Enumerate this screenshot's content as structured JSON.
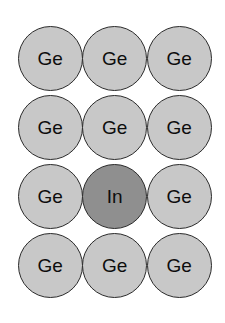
{
  "figure": {
    "type": "crystal-lattice-substitution-diagram",
    "background_color": "#ffffff",
    "grid": {
      "columns": 3,
      "rows": 4,
      "origin_x": 18,
      "origin_y": 24,
      "cell_width": 64.5,
      "cell_height": 69,
      "circle_diameter": 65
    },
    "styles": {
      "host_fill": "#c8c8c8",
      "dopant_fill": "#8f8f8f",
      "outline_color": "#2b2b2b",
      "outline_width": 1.4,
      "label_color": "#0d0d0d",
      "label_font_size": 19
    },
    "legend_note": "",
    "atoms": [
      {
        "id": "atom-r1c1",
        "label": "Ge",
        "row": 1,
        "col": 1,
        "kind": "host",
        "fill": "#c8c8c8"
      },
      {
        "id": "atom-r1c2",
        "label": "Ge",
        "row": 1,
        "col": 2,
        "kind": "host",
        "fill": "#c8c8c8"
      },
      {
        "id": "atom-r1c3",
        "label": "Ge",
        "row": 1,
        "col": 3,
        "kind": "host",
        "fill": "#c8c8c8"
      },
      {
        "id": "atom-r2c1",
        "label": "Ge",
        "row": 2,
        "col": 1,
        "kind": "host",
        "fill": "#c8c8c8"
      },
      {
        "id": "atom-r2c2",
        "label": "Ge",
        "row": 2,
        "col": 2,
        "kind": "host",
        "fill": "#c8c8c8"
      },
      {
        "id": "atom-r2c3",
        "label": "Ge",
        "row": 2,
        "col": 3,
        "kind": "host",
        "fill": "#c8c8c8"
      },
      {
        "id": "atom-r3c1",
        "label": "Ge",
        "row": 3,
        "col": 1,
        "kind": "host",
        "fill": "#c8c8c8"
      },
      {
        "id": "atom-r3c2",
        "label": "In",
        "row": 3,
        "col": 2,
        "kind": "dopant",
        "fill": "#8f8f8f"
      },
      {
        "id": "atom-r3c3",
        "label": "Ge",
        "row": 3,
        "col": 3,
        "kind": "host",
        "fill": "#c8c8c8"
      },
      {
        "id": "atom-r4c1",
        "label": "Ge",
        "row": 4,
        "col": 1,
        "kind": "host",
        "fill": "#c8c8c8"
      },
      {
        "id": "atom-r4c2",
        "label": "Ge",
        "row": 4,
        "col": 2,
        "kind": "host",
        "fill": "#c8c8c8"
      },
      {
        "id": "atom-r4c3",
        "label": "Ge",
        "row": 4,
        "col": 3,
        "kind": "host",
        "fill": "#c8c8c8"
      }
    ]
  }
}
